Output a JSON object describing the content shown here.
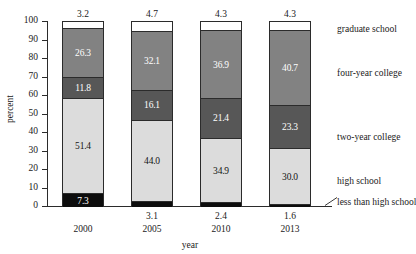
{
  "chart": {
    "title": "",
    "xlabel": "year",
    "ylabel": "percent"
  },
  "axis": {
    "y_ticks": [
      "100",
      "90",
      "80",
      "70",
      "60",
      "50",
      "40",
      "30",
      "20",
      "10",
      "0"
    ]
  },
  "categories_labels": [
    {
      "name": "graduate-school",
      "label": "graduate school"
    },
    {
      "name": "four-year-college",
      "label": "four-year college"
    },
    {
      "name": "two-year-college",
      "label": "two-year college"
    },
    {
      "name": "high-school",
      "label": "high school"
    },
    {
      "name": "less-than-high-school",
      "label": "less than high school"
    }
  ],
  "bars": [
    {
      "year": "2000",
      "top_value": "3.2",
      "segments": [
        {
          "key": "graduate school",
          "value": "3.2",
          "label": ""
        },
        {
          "key": "four-year college",
          "value": "26.3",
          "label": "26.3"
        },
        {
          "key": "two-year college",
          "value": "11.8",
          "label": "11.8"
        },
        {
          "key": "high school",
          "value": "51.4",
          "label": "51.4"
        },
        {
          "key": "less than high school",
          "value": "7.3",
          "label": "7.3"
        }
      ]
    },
    {
      "year": "2005",
      "top_value": "4.7",
      "segments": [
        {
          "key": "graduate school",
          "value": "4.7",
          "label": ""
        },
        {
          "key": "four-year college",
          "value": "32.1",
          "label": "32.1"
        },
        {
          "key": "two-year college",
          "value": "16.1",
          "label": "16.1"
        },
        {
          "key": "high school",
          "value": "44.0",
          "label": "44.0"
        },
        {
          "key": "less than high school",
          "value": "3.1",
          "label": ""
        }
      ]
    },
    {
      "year": "2010",
      "top_value": "4.3",
      "segments": [
        {
          "key": "graduate school",
          "value": "4.3",
          "label": ""
        },
        {
          "key": "four-year college",
          "value": "36.9",
          "label": "36.9"
        },
        {
          "key": "two-year college",
          "value": "21.4",
          "label": "21.4"
        },
        {
          "key": "high school",
          "value": "34.9",
          "label": "34.9"
        },
        {
          "key": "less than high school",
          "value": "2.4",
          "label": ""
        }
      ]
    },
    {
      "year": "2013",
      "top_value": "4.3",
      "segments": [
        {
          "key": "graduate school",
          "value": "4.3",
          "label": ""
        },
        {
          "key": "four-year college",
          "value": "40.7",
          "label": "40.7"
        },
        {
          "key": "two-year college",
          "value": "23.3",
          "label": "23.3"
        },
        {
          "key": "high school",
          "value": "30.0",
          "label": "30.0"
        },
        {
          "key": "less than high school",
          "value": "1.6",
          "label": ""
        }
      ]
    }
  ],
  "bar_sub_values": [
    "",
    "3.1",
    "2.4",
    "1.6"
  ],
  "chart_data": {
    "type": "bar",
    "subtype": "stacked-bar-100-percent",
    "title": "",
    "xlabel": "year",
    "ylabel": "percent",
    "ylim": [
      0,
      100
    ],
    "ytick_step": 10,
    "grid": false,
    "legend_position": "right-inline-labels",
    "categories": [
      "2000",
      "2005",
      "2010",
      "2013"
    ],
    "series": [
      {
        "name": "less than high school",
        "values": [
          7.3,
          3.1,
          2.4,
          1.6
        ],
        "color": "#0d0d0d"
      },
      {
        "name": "high school",
        "values": [
          51.4,
          44.0,
          34.9,
          30.0
        ],
        "color": "#dcdcdc"
      },
      {
        "name": "two-year college",
        "values": [
          11.8,
          16.1,
          21.4,
          23.3
        ],
        "color": "#575757"
      },
      {
        "name": "four-year college",
        "values": [
          26.3,
          32.1,
          36.9,
          40.7
        ],
        "color": "#828282"
      },
      {
        "name": "graduate school",
        "values": [
          3.2,
          4.7,
          4.3,
          4.3
        ],
        "color": "#ffffff"
      }
    ],
    "annotations": [
      {
        "text": "3.2",
        "position": "above-bar-2000"
      },
      {
        "text": "4.7",
        "position": "above-bar-2005"
      },
      {
        "text": "4.3",
        "position": "above-bar-2010"
      },
      {
        "text": "4.3",
        "position": "above-bar-2013"
      },
      {
        "text": "3.1",
        "position": "below-bar-2005"
      },
      {
        "text": "2.4",
        "position": "below-bar-2010"
      },
      {
        "text": "1.6",
        "position": "below-bar-2013"
      }
    ]
  },
  "colors": {
    "graduate_school": "#ffffff",
    "four_year_college": "#828282",
    "two_year_college": "#575757",
    "high_school": "#dcdcdc",
    "less_than_high_school": "#0d0d0d",
    "axis": "#2b2b2b",
    "text": "#1a1a1a"
  }
}
